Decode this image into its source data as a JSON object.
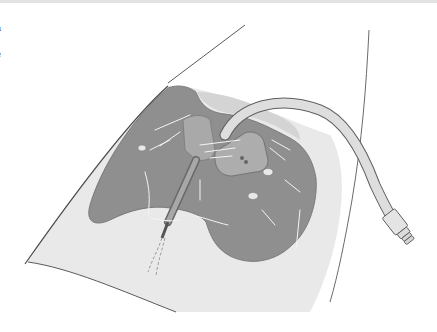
{
  "figure": {
    "edge_text_fragments": [
      "a",
      "i",
      "e",
      "t",
      "l"
    ],
    "colors": {
      "background": "#ffffff",
      "top_bar": "#e2e2e2",
      "skin": "#e9e9e9",
      "dressing": "#8f8f8f",
      "dressing_highlight": "#d4d4d4",
      "tube": "#dedede",
      "outline": "#5a5a5a",
      "highlight_lines": "#f4f4f4"
    }
  }
}
